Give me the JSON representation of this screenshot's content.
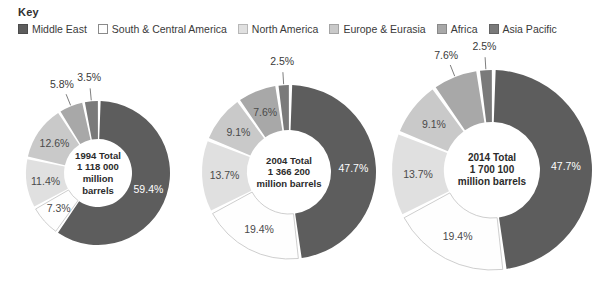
{
  "key": {
    "title": "Key",
    "items": [
      {
        "label": "Middle East",
        "color": "#5d5d5d"
      },
      {
        "label": "South & Central America",
        "color": "#fefefe"
      },
      {
        "label": "North America",
        "color": "#e0e0e0"
      },
      {
        "label": "Europe & Eurasia",
        "color": "#c9c9c9"
      },
      {
        "label": "Africa",
        "color": "#a8a8a8"
      },
      {
        "label": "Asia Pacific",
        "color": "#7a7a7a"
      }
    ]
  },
  "chart_data": [
    {
      "type": "pie",
      "title": "1994 Total 1 118 000 million barrels",
      "center_lines": [
        "1994 Total",
        "1 118 000",
        "million",
        "barrels"
      ],
      "categories": [
        "Middle East",
        "South & Central America",
        "North America",
        "Europe & Eurasia",
        "Africa",
        "Asia Pacific"
      ],
      "values": [
        59.4,
        7.3,
        11.4,
        12.6,
        5.8,
        3.5
      ],
      "labels": [
        "59.4%",
        "7.3%",
        "11.4%",
        "12.6%",
        "5.8%",
        "3.5%"
      ],
      "total": "1 118 000 million barrels",
      "year": "1994"
    },
    {
      "type": "pie",
      "title": "2004 Total 1 366 200 million barrels",
      "center_lines": [
        "2004 Total",
        "1 366 200",
        "million barrels"
      ],
      "categories": [
        "Middle East",
        "South & Central America",
        "North America",
        "Europe & Eurasia",
        "Africa",
        "Asia Pacific"
      ],
      "values": [
        47.7,
        19.4,
        13.7,
        9.1,
        7.6,
        2.5
      ],
      "labels": [
        "47.7%",
        "19.4%",
        "13.7%",
        "9.1%",
        "7.6%",
        "2.5%"
      ],
      "total": "1 366 200 million barrels",
      "year": "2004"
    },
    {
      "type": "pie",
      "title": "2014 Total 1 700 100 million barrels",
      "center_lines": [
        "2014 Total",
        "1 700 100",
        "million barrels"
      ],
      "categories": [
        "Middle East",
        "South & Central America",
        "North America",
        "Europe & Eurasia",
        "Africa",
        "Asia Pacific"
      ],
      "values": [
        47.7,
        19.4,
        13.7,
        9.1,
        7.6,
        2.5
      ],
      "labels": [
        "47.7%",
        "19.4%",
        "13.7%",
        "9.1%",
        "7.6%",
        "2.5%"
      ],
      "total": "1 700 100 million barrels",
      "year": "2014"
    }
  ],
  "charts_layout": [
    {
      "cx": 98,
      "cy": 173,
      "r_outer": 72,
      "r_inner": 34,
      "center_font": 9.5
    },
    {
      "cx": 289,
      "cy": 172,
      "r_outer": 87,
      "r_inner": 42,
      "center_font": 9.5
    },
    {
      "cx": 492,
      "cy": 170,
      "r_outer": 100,
      "r_inner": 48,
      "center_font": 10
    }
  ]
}
